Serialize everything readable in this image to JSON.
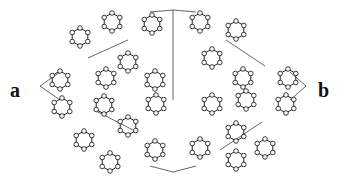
{
  "labels": {
    "a": "a",
    "b": "b"
  },
  "colors": {
    "line": "#222222",
    "atom_fill": "#ffffff",
    "background": "#ffffff"
  },
  "rings": [
    [
      80,
      37
    ],
    [
      112,
      22
    ],
    [
      152,
      24
    ],
    [
      200,
      22
    ],
    [
      236,
      30
    ],
    [
      60,
      80
    ],
    [
      106,
      78
    ],
    [
      128,
      62
    ],
    [
      155,
      80
    ],
    [
      212,
      58
    ],
    [
      243,
      78
    ],
    [
      288,
      78
    ],
    [
      62,
      107
    ],
    [
      104,
      105
    ],
    [
      156,
      104
    ],
    [
      212,
      104
    ],
    [
      246,
      100
    ],
    [
      286,
      104
    ],
    [
      84,
      140
    ],
    [
      128,
      126
    ],
    [
      155,
      150
    ],
    [
      200,
      148
    ],
    [
      236,
      132
    ],
    [
      265,
      148
    ],
    [
      110,
      162
    ],
    [
      236,
      160
    ]
  ],
  "cell_lines": [
    [
      [
        40,
        86
      ],
      [
        60,
        72
      ]
    ],
    [
      [
        40,
        86
      ],
      [
        60,
        100
      ]
    ],
    [
      [
        306,
        86
      ],
      [
        290,
        72
      ]
    ],
    [
      [
        306,
        86
      ],
      [
        290,
        100
      ]
    ],
    [
      [
        88,
        58
      ],
      [
        128,
        40
      ]
    ],
    [
      [
        173,
        10
      ],
      [
        173,
        100
      ]
    ],
    [
      [
        173,
        10
      ],
      [
        150,
        12
      ]
    ],
    [
      [
        173,
        10
      ],
      [
        196,
        12
      ]
    ],
    [
      [
        226,
        40
      ],
      [
        265,
        66
      ]
    ],
    [
      [
        94,
        110
      ],
      [
        133,
        130
      ]
    ],
    [
      [
        173,
        172
      ],
      [
        150,
        166
      ]
    ],
    [
      [
        173,
        172
      ],
      [
        196,
        166
      ]
    ],
    [
      [
        220,
        150
      ],
      [
        262,
        122
      ]
    ]
  ]
}
